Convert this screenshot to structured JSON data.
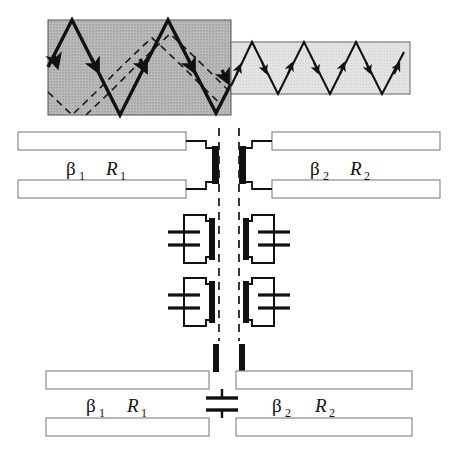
{
  "figure": {
    "colors": {
      "ink": "#111111",
      "line": "#1a1a1a",
      "outline": "#8a8a8a",
      "fill_white": "#ffffff",
      "ray_box_dark_fill": "#b4b4b4",
      "ray_box_light_fill": "#e2e2e2",
      "box_edge": "#555555",
      "black_bar": "#111111",
      "dashed": "#222222"
    },
    "ray_diagram": {
      "name": "ray-bounce-diagram",
      "guides": [
        {
          "name": "thick-guide",
          "fill_shade": "dark",
          "x": 48,
          "y": 20,
          "width": 183,
          "height": 95,
          "ray_style": "solid-bold",
          "bounce_count": 8,
          "has_dashed_companion_ray": true
        },
        {
          "name": "thin-guide",
          "fill_shade": "light",
          "x": 231,
          "y": 42,
          "width": 179,
          "height": 52,
          "ray_style": "solid-thin",
          "bounce_count": 5,
          "has_dashed_companion_ray": false
        }
      ]
    },
    "upper_circuit": {
      "name": "upper-equivalent-circuit",
      "left_port": {
        "beta_label": "β",
        "beta_sub": "1",
        "r_label": "R",
        "r_sub": "1"
      },
      "right_port": {
        "beta_label": "β",
        "beta_sub": "2",
        "r_label": "R",
        "r_sub": "2"
      },
      "junction": {
        "name": "reference-plane-junction",
        "black_bar_count": 2,
        "dashed_reference_lines": 2
      },
      "resonator_rows": [
        {
          "name": "resonator-row-1",
          "cells": [
            {
              "name": "lc-cell-left",
              "element": "capacitor",
              "plates": 2
            },
            {
              "name": "lc-cell-right",
              "element": "capacitor",
              "plates": 2
            }
          ]
        },
        {
          "name": "resonator-row-2",
          "cells": [
            {
              "name": "lc-cell-left",
              "element": "capacitor",
              "plates": 2
            },
            {
              "name": "lc-cell-right",
              "element": "capacitor",
              "plates": 2
            }
          ]
        }
      ]
    },
    "lower_circuit": {
      "name": "lower-equivalent-circuit",
      "left_port": {
        "beta_label": "β",
        "beta_sub": "1",
        "r_label": "R",
        "r_sub": "1"
      },
      "right_port": {
        "beta_label": "β",
        "beta_sub": "2",
        "r_label": "R",
        "r_sub": "2"
      },
      "shunt_element": {
        "name": "shunt-capacitor",
        "element": "capacitor",
        "plates": 2
      },
      "stub_bars": 2
    }
  }
}
